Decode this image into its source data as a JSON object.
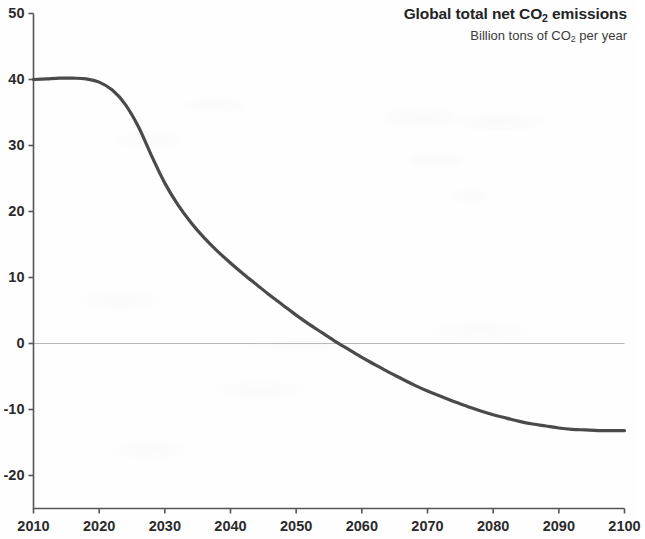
{
  "chart_data": {
    "type": "line",
    "title": "Global total net CO2 emissions",
    "title_parts": {
      "pre": "Global total net CO",
      "sub": "2",
      "post": " emissions"
    },
    "subtitle": "Billion tons of CO2 per year",
    "subtitle_parts": {
      "pre": "Billion tons of CO",
      "sub": "2",
      "post": " per year"
    },
    "xlabel": "",
    "ylabel": "",
    "xlim": [
      2010,
      2100
    ],
    "ylim": [
      -25,
      50
    ],
    "xticks": [
      2010,
      2020,
      2030,
      2040,
      2050,
      2060,
      2070,
      2080,
      2090,
      2100
    ],
    "xtick_labels": [
      "2010",
      "2020",
      "2030",
      "2040",
      "2050",
      "2060",
      "2070",
      "2080",
      "2090",
      "2100"
    ],
    "yticks": [
      50,
      40,
      30,
      20,
      10,
      0,
      -10,
      -20
    ],
    "ytick_labels": [
      "50",
      "40",
      "30",
      "20",
      "10",
      "0",
      "-10",
      "-20"
    ],
    "grid": false,
    "zero_line": true,
    "zero_line_color": "#b9b9b9",
    "line_color": "#4a4a4a",
    "line_width": 3.2,
    "axis_color": "#555555",
    "background": "#fefefe",
    "legend": null,
    "annotations": [],
    "series": [
      {
        "name": "Global total net CO2 emissions",
        "x": [
          2010,
          2012,
          2014,
          2016,
          2018,
          2020,
          2022,
          2024,
          2026,
          2028,
          2030,
          2032,
          2034,
          2036,
          2038,
          2040,
          2042,
          2044,
          2046,
          2048,
          2050,
          2052,
          2054,
          2056,
          2058,
          2060,
          2062,
          2064,
          2066,
          2068,
          2070,
          2072,
          2074,
          2076,
          2078,
          2080,
          2082,
          2084,
          2086,
          2088,
          2090,
          2092,
          2094,
          2096,
          2098,
          2100
        ],
        "values": [
          40.0,
          40.1,
          40.2,
          40.2,
          40.1,
          39.6,
          38.4,
          36.2,
          32.8,
          28.4,
          24.3,
          21.0,
          18.3,
          16.0,
          14.0,
          12.2,
          10.5,
          8.9,
          7.3,
          5.8,
          4.3,
          2.9,
          1.6,
          0.3,
          -0.9,
          -2.1,
          -3.2,
          -4.3,
          -5.3,
          -6.3,
          -7.2,
          -8.0,
          -8.8,
          -9.5,
          -10.2,
          -10.8,
          -11.3,
          -11.8,
          -12.2,
          -12.5,
          -12.8,
          -13.0,
          -13.1,
          -13.2,
          -13.2,
          -13.2
        ]
      }
    ],
    "key_points": {
      "start_year": 2010,
      "start_value": 40,
      "peak_year": 2016,
      "peak_value": 40.2,
      "net_zero_year": 2050,
      "end_year": 2100,
      "end_value": -13.2
    }
  }
}
